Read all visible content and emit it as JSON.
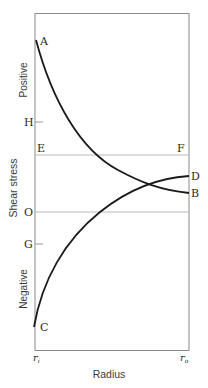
{
  "diagram": {
    "xlabel": "Radius",
    "ylabel": "Shear stress",
    "y_region_labels": {
      "positive": "Positive",
      "negative": "Negative"
    },
    "x_ticks": {
      "inner_radius": {
        "base": "r",
        "sub": "i"
      },
      "outer_radius": {
        "base": "r",
        "sub": "o"
      }
    },
    "points": {
      "A": "A",
      "B": "B",
      "C": "C",
      "D": "D",
      "E": "E",
      "F": "F",
      "H": "H",
      "O": "O",
      "G": "G"
    },
    "curves": [
      {
        "name": "curve-AB",
        "from": "A",
        "to": "B",
        "description": "Decreasing positive shear stress from inner to outer radius"
      },
      {
        "name": "curve-CD",
        "from": "C",
        "to": "D",
        "description": "Increasing shear stress from negative at inner radius to positive at outer radius"
      }
    ],
    "reference_lines": [
      {
        "name": "line-EF",
        "from": "E",
        "to": "F"
      },
      {
        "name": "line-O",
        "label": "O",
        "description": "Zero shear stress"
      }
    ],
    "ticks": [
      "H",
      "G"
    ],
    "colors": {
      "frame": "#8a8a8a",
      "curve": "#1a1a1a",
      "reference_line": "#b8b8b8"
    }
  }
}
